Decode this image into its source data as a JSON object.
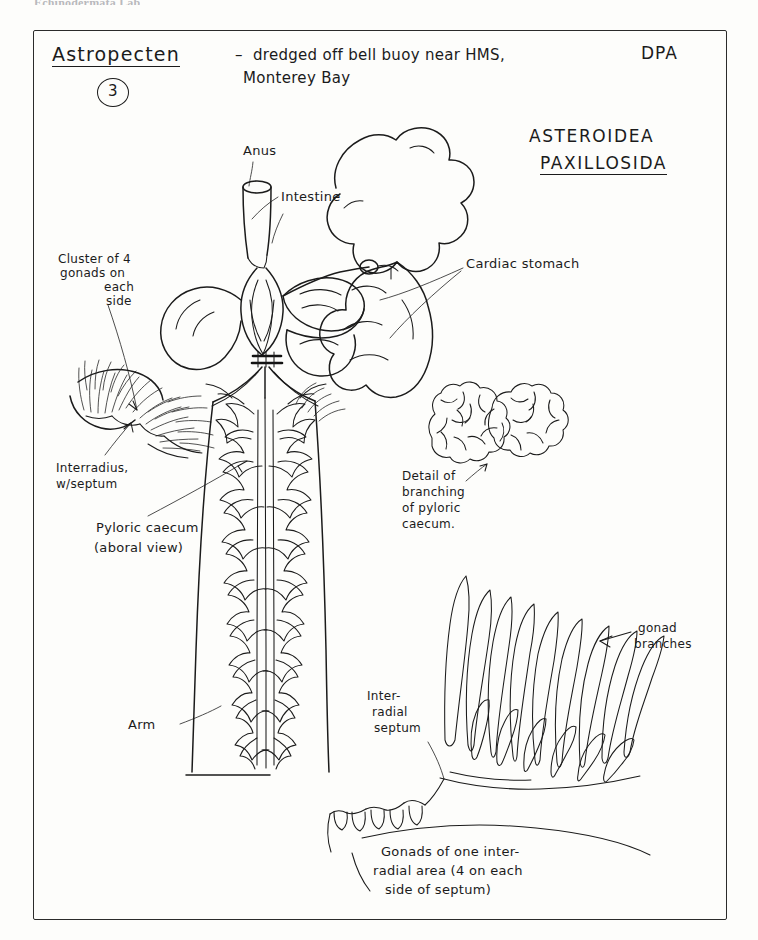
{
  "page": {
    "running_header": "Echinodermata Lab",
    "width": 758,
    "height": 940,
    "ink_color": "#1b1b1b",
    "paper_color": "#fdfdfb"
  },
  "header": {
    "specimen_name": "Astropecten",
    "plate_number": "3",
    "collection_note_line1": "–  dredged off bell buoy near HMS,",
    "collection_note_line2": "Monterey Bay",
    "initials": "DPA"
  },
  "taxonomy": {
    "class": "ASTEROIDEA",
    "order": "PAXILLOSIDA"
  },
  "labels": [
    {
      "id": "anus",
      "text": "Anus"
    },
    {
      "id": "intestine",
      "text": "Intestine"
    },
    {
      "id": "cardiac-stomach",
      "text": "Cardiac stomach"
    },
    {
      "id": "gonad-cluster",
      "text": "Cluster of 4\ngonads on\neach\nside"
    },
    {
      "id": "interradius-septum",
      "text": "Interradius,\nw/septum"
    },
    {
      "id": "pyloric-caecum",
      "text": "Pyloric caecum\n(aboral view)"
    },
    {
      "id": "detail-branching",
      "text": "Detail of\nbranching\nof pyloric\ncaecum."
    },
    {
      "id": "arm",
      "text": "Arm"
    },
    {
      "id": "interradial-septum",
      "text": "Inter-\nradial\nseptum"
    },
    {
      "id": "gonad-branches",
      "text": "gonad\nbranches"
    }
  ],
  "label_lines": {
    "gonad_cluster_l1": "Cluster of 4",
    "gonad_cluster_l2": "gonads on",
    "gonad_cluster_l3": "each",
    "gonad_cluster_l4": "side",
    "interradius_l1": "Interradius,",
    "interradius_l2": "w/septum",
    "pyloric_l1": "Pyloric caecum",
    "pyloric_l2": "(aboral view)",
    "detail_l1": "Detail of",
    "detail_l2": "branching",
    "detail_l3": "of pyloric",
    "detail_l4": "caecum.",
    "interradial_l1": "Inter-",
    "interradial_l2": "radial",
    "interradial_l3": "septum",
    "gonad_branch_l1": "gonad",
    "gonad_branch_l2": "branches",
    "anus": "Anus",
    "intestine": "Intestine",
    "cardiac": "Cardiac stomach",
    "arm": "Arm"
  },
  "caption": {
    "line1": "Gonads of one inter-",
    "line2": "radial area (4 on each",
    "line3": "side of septum)"
  },
  "figure": {
    "parts": [
      "anus",
      "intestine",
      "cardiac stomach",
      "pyloric caeca",
      "gonad clusters",
      "interradial septum",
      "arm"
    ]
  }
}
